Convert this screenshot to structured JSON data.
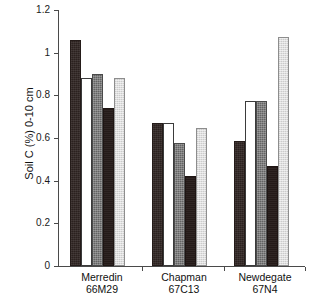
{
  "chart_data": {
    "type": "bar",
    "title": "",
    "xlabel": "",
    "ylabel": "Soil C (%) 0-10 cm",
    "ylim": [
      0,
      1.2
    ],
    "yticks": [
      "0",
      "0.2",
      "0.4",
      "0.6",
      "0.8",
      "1",
      "1.2"
    ],
    "ytick_values": [
      0,
      0.2,
      0.4,
      0.6,
      0.8,
      1.0,
      1.2
    ],
    "grid": false,
    "legend": "none",
    "categories": [
      "Merredin 66M29",
      "Chapman 67C13",
      "Newdegate 67N4"
    ],
    "category_lines": [
      {
        "line1": "Merredin",
        "line2": "66M29"
      },
      {
        "line1": "Chapman",
        "line2": "67C13"
      },
      {
        "line1": "Newdegate",
        "line2": "67N4"
      }
    ],
    "series": [
      {
        "name": "bar-1",
        "swatch": "dark-textured",
        "color": "#2b211f",
        "values": [
          1.06,
          0.67,
          0.585
        ]
      },
      {
        "name": "bar-2",
        "swatch": "white",
        "color": "#ffffff",
        "values": [
          0.88,
          0.67,
          0.775
        ]
      },
      {
        "name": "bar-3",
        "swatch": "medium-gray",
        "color": "#636363",
        "values": [
          0.9,
          0.575,
          0.775
        ]
      },
      {
        "name": "bar-4",
        "swatch": "very-dark",
        "color": "#241a18",
        "values": [
          0.74,
          0.42,
          0.47
        ]
      },
      {
        "name": "bar-5",
        "swatch": "light-gray",
        "color": "#dedede",
        "values": [
          0.88,
          0.645,
          1.075
        ]
      }
    ]
  },
  "axis": {
    "y_title": "Soil C (%) 0-10 cm"
  }
}
